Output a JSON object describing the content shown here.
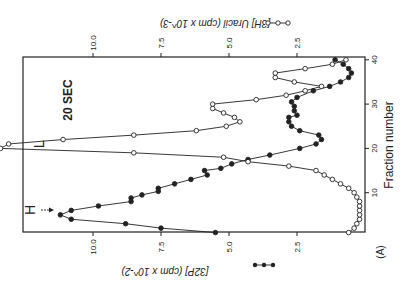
{
  "figure": {
    "panel_label": "(A)",
    "annotation_time": "20 SEC",
    "marker_heavy": "H",
    "marker_light": "L",
    "rotation": "rotated 90 degrees clockwise"
  },
  "chart_data": {
    "type": "line",
    "title": "",
    "annotations": [
      "20 SEC",
      "H",
      "L",
      "(A)"
    ],
    "xlabel": "Fraction number",
    "x_ticks": [
      10,
      20,
      30,
      40
    ],
    "xlim": [
      0,
      41
    ],
    "ylabel_left": "[32P] (cpm x 10^-2)",
    "ylabel_right": "[3H] Uracil (cpm x 10^-3)",
    "y_ticks_left": [
      2.5,
      5.0,
      7.5,
      10.0
    ],
    "y_ticks_right": [
      2.5,
      5.0,
      7.5,
      10.0
    ],
    "ylim": [
      0,
      13.4
    ],
    "grid": false,
    "legend": [
      {
        "name": "[32P] (cpm x 10^-2)",
        "marker": "filled circle"
      },
      {
        "name": "[3H] Uracil (cpm x 10^-3)",
        "marker": "open circle"
      }
    ],
    "x": [
      1,
      2,
      3,
      4,
      5,
      6,
      7,
      8,
      9,
      10,
      11,
      12,
      13,
      14,
      15,
      16,
      17,
      18,
      19,
      20,
      21,
      22,
      23,
      24,
      25,
      26,
      27,
      28,
      29,
      30,
      31,
      32,
      33,
      34,
      35,
      36,
      37,
      38,
      39,
      40
    ],
    "series": [
      {
        "name": "[32P] (cpm x 10^-2)",
        "marker": "filled",
        "axis": "left",
        "x": [
          1,
          2,
          3,
          4,
          5,
          6,
          7,
          8,
          8.8,
          9.5,
          10.3,
          11,
          12,
          13,
          14,
          15,
          15.5,
          16.5,
          17.5,
          18.5,
          20,
          21,
          22,
          23,
          24,
          25,
          26,
          27,
          27.5,
          28.5,
          29.5,
          30.5,
          31.5,
          33,
          34,
          35,
          36,
          37,
          38,
          39,
          40
        ],
        "values": [
          5.5,
          7.5,
          8.8,
          10.8,
          11.2,
          10.8,
          9.8,
          8.6,
          8.6,
          8.2,
          7.6,
          7.6,
          7.0,
          6.4,
          5.8,
          5.9,
          5.3,
          4.9,
          4.3,
          3.5,
          2.4,
          1.8,
          1.6,
          1.7,
          2.4,
          2.7,
          2.8,
          2.8,
          2.5,
          2.6,
          2.6,
          2.7,
          2.5,
          1.9,
          1.3,
          0.9,
          0.6,
          0.5,
          0.6,
          0.8,
          1.1
        ]
      },
      {
        "name": "[3H] Uracil (cpm x 10^-3)",
        "marker": "open",
        "axis": "right",
        "values": [
          0.6,
          0.4,
          0.3,
          0.2,
          0.2,
          0.2,
          0.2,
          0.2,
          0.3,
          0.4,
          0.6,
          0.9,
          1.2,
          1.5,
          1.8,
          2.8,
          4.3,
          5.2,
          8.5,
          13.4,
          13.1,
          11.1,
          8.5,
          6.2,
          5.1,
          4.6,
          4.8,
          5.2,
          5.6,
          5.6,
          4.0,
          2.9,
          2.2,
          1.6,
          2.6,
          3.3,
          3.3,
          2.2,
          1.2,
          0.7
        ]
      }
    ]
  },
  "layout": {
    "frame": {
      "left": 23,
      "top": 57,
      "right": 365,
      "bottom": 232
    },
    "x_of_value": {
      "origin": 365,
      "px_per_unit": 27.2
    },
    "y_of_fraction": {
      "origin": 237,
      "px_per_unit": 4.43
    }
  },
  "colors": {
    "ink": "#222222",
    "background": "#ffffff"
  }
}
